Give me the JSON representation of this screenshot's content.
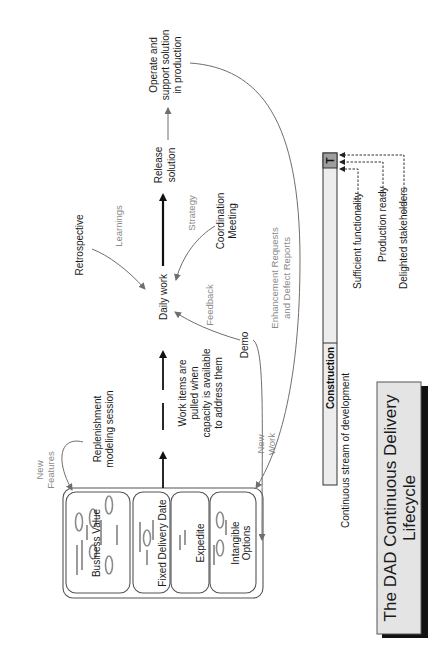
{
  "title": {
    "line1": "The DAD Continuous Delivery",
    "line2": "Lifecycle",
    "fill_color": "#e4e4e4",
    "shadow_color": "#111111"
  },
  "backlog": {
    "incoming_label": {
      "line1": "New",
      "line2": "Features"
    },
    "lanes": [
      {
        "label": "Business Value"
      },
      {
        "label": "Fixed Delivery Date"
      },
      {
        "label": "Expedite"
      },
      {
        "label": "Intangible",
        "label2": "Options"
      }
    ]
  },
  "activities": {
    "replenishment": {
      "line1": "Replenishment",
      "line2": "modeling session"
    },
    "pull_note": {
      "line1": "Work items are",
      "line2": "pulled when",
      "line3": "capacity is available",
      "line4": "to address them"
    },
    "daily_work": "Daily work",
    "retrospective": "Retrospective",
    "learnings": "Learnings",
    "coordination": {
      "line1": "Coordination",
      "line2": "Meeting"
    },
    "strategy": "Strategy",
    "demo": "Demo",
    "feedback": "Feedback",
    "new_work": {
      "line1": "New",
      "line2": "Work"
    },
    "release": {
      "line1": "Release",
      "line2": "solution"
    },
    "operate": {
      "line1": "Operate and",
      "line2": "support solution",
      "line3": "in production"
    },
    "enhancements": {
      "line1": "Enhancement Requests",
      "line2": "and Defect Reports"
    }
  },
  "phase_bar": {
    "phase_label": "Construction",
    "transition_label": "T",
    "description": "Continuous stream of development",
    "milestones": [
      "Sufficient functionality",
      "Production ready",
      "Delighted stakeholders"
    ],
    "bar_color": "#ededed",
    "transition_color": "#9e9e9e"
  }
}
